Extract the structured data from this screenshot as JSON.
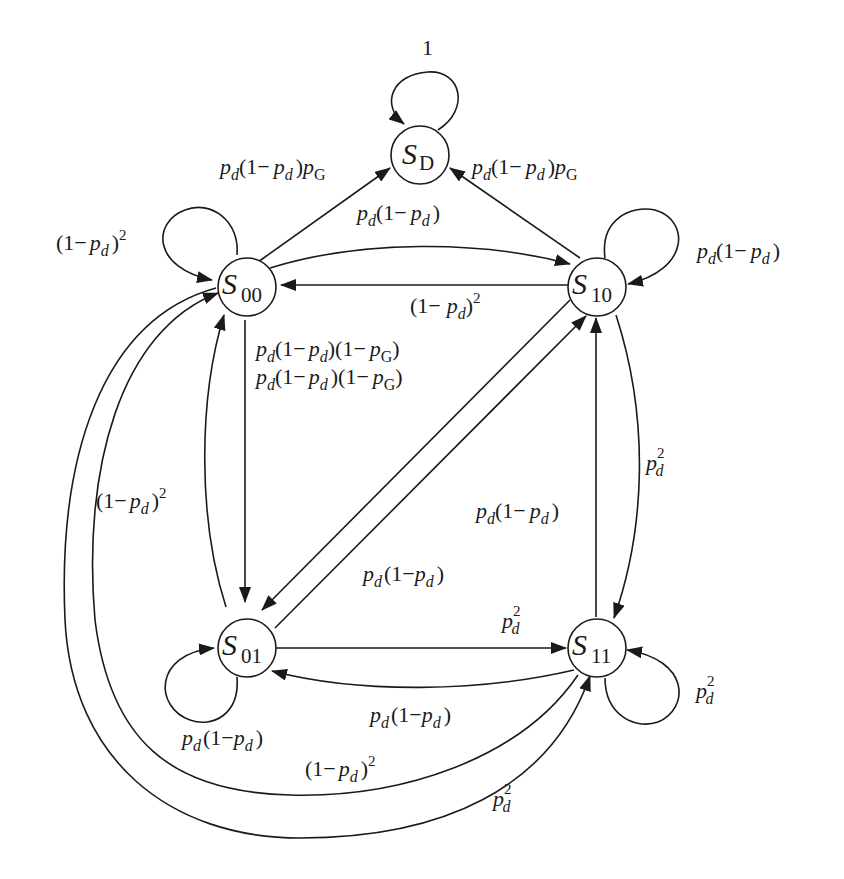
{
  "diagram": {
    "type": "state-transition-diagram",
    "nodes": [
      {
        "id": "SD",
        "label": "S",
        "subscript": "D"
      },
      {
        "id": "S00",
        "label": "S",
        "subscript": "00"
      },
      {
        "id": "S10",
        "label": "S",
        "subscript": "10"
      },
      {
        "id": "S01",
        "label": "S",
        "subscript": "01"
      },
      {
        "id": "S11",
        "label": "S",
        "subscript": "11"
      }
    ],
    "edges": [
      {
        "from": "SD",
        "to": "SD",
        "label": "1"
      },
      {
        "from": "S00",
        "to": "SD",
        "label": "p_d(1−p_d)p_G"
      },
      {
        "from": "S10",
        "to": "SD",
        "label": "p_d(1−p_d)p_G"
      },
      {
        "from": "S00",
        "to": "S00",
        "label": "(1−p_d)^2"
      },
      {
        "from": "S00",
        "to": "S10",
        "label": "p_d(1−p_d)"
      },
      {
        "from": "S10",
        "to": "S00",
        "label": "(1−p_d)^2"
      },
      {
        "from": "S10",
        "to": "S10",
        "label": "p_d(1−p_d)"
      },
      {
        "from": "S00",
        "to": "S01",
        "label": "p_d(1−p_d)(1−p_G)"
      },
      {
        "from": "S10",
        "to": "S01",
        "label": "p_d(1−p_d)(1−p_G)"
      },
      {
        "from": "S01",
        "to": "S00",
        "label": "(1−p_d)^2"
      },
      {
        "from": "S01",
        "to": "S10",
        "label": "p_d(1−p_d)"
      },
      {
        "from": "S10",
        "to": "S11",
        "label": "p_d^2"
      },
      {
        "from": "S11",
        "to": "S10",
        "label": "p_d(1−p_d)"
      },
      {
        "from": "S01",
        "to": "S11",
        "label": "p_d^2"
      },
      {
        "from": "S11",
        "to": "S01",
        "label": "p_d(1−p_d)"
      },
      {
        "from": "S01",
        "to": "S01",
        "label": "p_d(1−p_d)"
      },
      {
        "from": "S11",
        "to": "S11",
        "label": "p_d^2"
      },
      {
        "from": "S11",
        "to": "S00",
        "label": "(1−p_d)^2"
      },
      {
        "from": "S00",
        "to": "S11",
        "label": "p_d^2"
      }
    ]
  },
  "text": {
    "nodes": {
      "SD": {
        "main": "S",
        "sub": "D"
      },
      "S00": {
        "main": "S",
        "sub": "00"
      },
      "S10": {
        "main": "S",
        "sub": "10"
      },
      "S01": {
        "main": "S",
        "sub": "01"
      },
      "S11": {
        "main": "S",
        "sub": "11"
      }
    },
    "p": "p",
    "d": "d",
    "G": "G",
    "one": "1",
    "one_minus": "(1−",
    "open_one_minus": "(1−",
    "close": ")",
    "sq": "2"
  }
}
